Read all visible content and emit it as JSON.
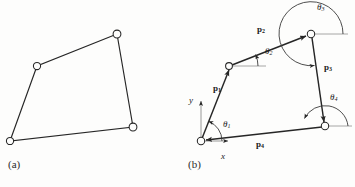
{
  "figure": {
    "panels": [
      {
        "caption": "(a)",
        "caption_pos": {
          "x": 8,
          "y": 160
        },
        "type": "polygon-open-vertices",
        "vertices": [
          {
            "name": "vertex-bottom-left",
            "x": 10,
            "y": 141
          },
          {
            "name": "vertex-left",
            "x": 37,
            "y": 66
          },
          {
            "name": "vertex-top",
            "x": 117,
            "y": 34
          },
          {
            "name": "vertex-right",
            "x": 133,
            "y": 127
          }
        ]
      },
      {
        "caption": "(b)",
        "caption_pos": {
          "x": 188,
          "y": 160
        },
        "type": "vector-polygon",
        "origin": {
          "name": "vertex-origin",
          "x": 201,
          "y": 141
        },
        "vertices": [
          {
            "name": "vertex-origin",
            "x": 201,
            "y": 141
          },
          {
            "name": "vertex-upper-left",
            "x": 229,
            "y": 66
          },
          {
            "name": "vertex-top-right",
            "x": 311,
            "y": 34
          },
          {
            "name": "vertex-lower-right",
            "x": 325,
            "y": 126
          }
        ],
        "vectors": [
          {
            "name": "vector-p1",
            "label": "p",
            "sub": "1",
            "from": "vertex-origin",
            "to": "vertex-upper-left",
            "label_pos": {
              "x": 215,
              "y": 88
            }
          },
          {
            "name": "vector-p2",
            "label": "p",
            "sub": "2",
            "from": "vertex-upper-left",
            "to": "vertex-top-right",
            "label_pos": {
              "x": 259,
              "y": 29
            }
          },
          {
            "name": "vector-p3",
            "label": "p",
            "sub": "3",
            "from": "vertex-top-right",
            "to": "vertex-lower-right",
            "label_pos": {
              "x": 325,
              "y": 67
            }
          },
          {
            "name": "vector-p4",
            "label": "p",
            "sub": "4",
            "from": "vertex-lower-right",
            "to": "vertex-origin",
            "label_pos": {
              "x": 257,
              "y": 143
            }
          }
        ],
        "angles": [
          {
            "name": "angle-theta1",
            "label": "θ",
            "sub": "1",
            "at": "vertex-origin",
            "label_pos": {
              "x": 224,
              "y": 124
            }
          },
          {
            "name": "angle-theta2",
            "label": "θ",
            "sub": "2",
            "at": "vertex-upper-left",
            "label_pos": {
              "x": 266,
              "y": 51
            }
          },
          {
            "name": "angle-theta3",
            "label": "θ",
            "sub": "3",
            "at": "vertex-top-right",
            "label_pos": {
              "x": 318,
              "y": 6
            }
          },
          {
            "name": "angle-theta4",
            "label": "θ",
            "sub": "4",
            "at": "vertex-lower-right",
            "label_pos": {
              "x": 331,
              "y": 97
            }
          }
        ],
        "axes": [
          {
            "name": "axis-y-label",
            "label": "y",
            "label_pos": {
              "x": 190,
              "y": 100
            }
          },
          {
            "name": "axis-x-label",
            "label": "x",
            "label_pos": {
              "x": 222,
              "y": 157
            }
          }
        ]
      }
    ],
    "colors": {
      "stroke": "#262626",
      "background": "#fdfdfc",
      "text": "#1a1a1a"
    }
  }
}
